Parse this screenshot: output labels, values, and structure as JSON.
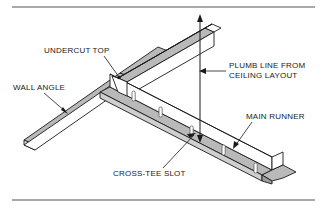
{
  "figure": {
    "kind": "technical-line-drawing",
    "background_color": "#ffffff",
    "line_color": "#1a1a1a",
    "shade_color": "#b9b9b9",
    "shade_color_dark": "#9d9d9d",
    "rule_color": "#8c8c8c"
  },
  "labels": {
    "undercut_top": "UNDERCUT TOP",
    "wall_angle": "WALL ANGLE",
    "plumb_line_1": "PLUMB LINE FROM",
    "plumb_line_2": "CEILING LAYOUT",
    "main_runner": "MAIN RUNNER",
    "cross_tee_slot": "CROSS-TEE SLOT"
  },
  "parts": [
    {
      "name": "wall-angle",
      "description": "L-shaped wall angle running lower-left to upper-right"
    },
    {
      "name": "main-runner",
      "description": "Inverted-T main runner running upper-right to lower-right"
    },
    {
      "name": "undercut-notch",
      "description": "Notched undercut at top of main runner where it rests on wall angle"
    },
    {
      "name": "cross-tee-slots",
      "description": "Row of rectangular slots punched in the main runner web",
      "count": 6
    },
    {
      "name": "plumb-line",
      "description": "Vertical double-headed arrow dropping from ceiling layout to the runner"
    }
  ],
  "rules": {
    "top": "horizontal rule above drawing",
    "bottom": "horizontal rule below drawing"
  }
}
